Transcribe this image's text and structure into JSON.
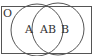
{
  "diagram": {
    "type": "venn",
    "universe_label": "O",
    "sets": [
      {
        "name": "A",
        "label": "A"
      },
      {
        "name": "B",
        "label": "B"
      }
    ],
    "intersection_label": "AB",
    "colors": {
      "stroke": "#555555",
      "text": "#333333",
      "background": "#ffffff"
    }
  }
}
